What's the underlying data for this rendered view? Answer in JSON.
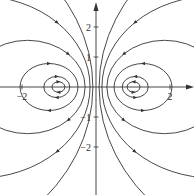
{
  "diagram": {
    "type": "phase-portrait",
    "colors": {
      "curve": "#333333",
      "axis": "#333333",
      "background": "#ffffff"
    },
    "origin_px": [
      96,
      87
    ],
    "scale_px": [
      37,
      30
    ],
    "x_ticks": [
      {
        "value": -2,
        "label": "−2"
      },
      {
        "value": 2,
        "label": "2"
      }
    ],
    "y_ticks": [
      {
        "value": 2,
        "label": "2"
      },
      {
        "value": 1,
        "label": "1"
      },
      {
        "value": -1,
        "label": "−1"
      },
      {
        "value": -2,
        "label": "−2"
      }
    ],
    "families": [
      {
        "side": "right",
        "centers": [
          1.015,
          1.06,
          1.27,
          1.85,
          3.2,
          6.0
        ]
      },
      {
        "side": "left",
        "centers": [
          -1.015,
          -1.06,
          -1.27,
          -1.85,
          -3.2,
          -6.0
        ]
      }
    ]
  }
}
